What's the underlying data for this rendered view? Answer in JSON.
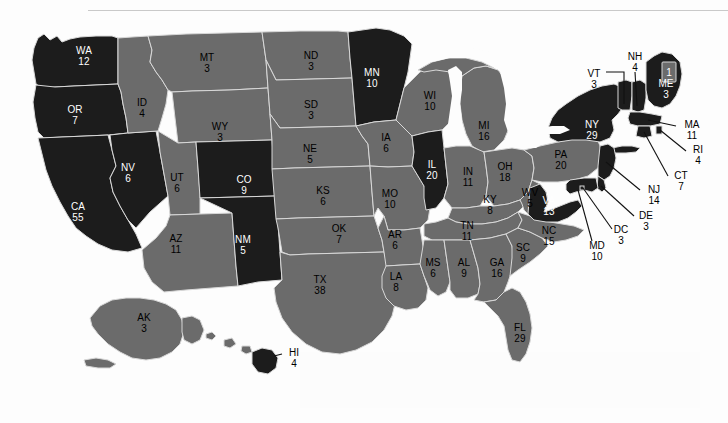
{
  "map": {
    "title": "United States Electoral College Map",
    "colors": {
      "democratic": "#1c1c1c",
      "republican": "#6b6b6b",
      "background": "#fdfdfd",
      "border": "#d8d8d8",
      "water": "#fdfdfd",
      "label_on_dark": "#ffffff",
      "label_on_gray": "#000000",
      "leader_line": "#111111"
    },
    "maine_district_box_label": "1"
  },
  "chart_data": {
    "type": "map",
    "legend": [
      {
        "name": "Democratic",
        "color": "#1c1c1c"
      },
      {
        "name": "Republican",
        "color": "#6b6b6b"
      }
    ],
    "total_electoral_votes": 538,
    "states": [
      {
        "abbr": "WA",
        "votes": "12",
        "party": "democratic"
      },
      {
        "abbr": "OR",
        "votes": "7",
        "party": "democratic"
      },
      {
        "abbr": "CA",
        "votes": "55",
        "party": "democratic"
      },
      {
        "abbr": "NV",
        "votes": "6",
        "party": "democratic"
      },
      {
        "abbr": "ID",
        "votes": "4",
        "party": "republican"
      },
      {
        "abbr": "MT",
        "votes": "3",
        "party": "republican"
      },
      {
        "abbr": "WY",
        "votes": "3",
        "party": "republican"
      },
      {
        "abbr": "UT",
        "votes": "6",
        "party": "republican"
      },
      {
        "abbr": "CO",
        "votes": "9",
        "party": "democratic"
      },
      {
        "abbr": "AZ",
        "votes": "11",
        "party": "republican"
      },
      {
        "abbr": "NM",
        "votes": "5",
        "party": "democratic"
      },
      {
        "abbr": "ND",
        "votes": "3",
        "party": "republican"
      },
      {
        "abbr": "SD",
        "votes": "3",
        "party": "republican"
      },
      {
        "abbr": "NE",
        "votes": "5",
        "party": "republican"
      },
      {
        "abbr": "KS",
        "votes": "6",
        "party": "republican"
      },
      {
        "abbr": "OK",
        "votes": "7",
        "party": "republican"
      },
      {
        "abbr": "TX",
        "votes": "38",
        "party": "republican"
      },
      {
        "abbr": "MN",
        "votes": "10",
        "party": "democratic"
      },
      {
        "abbr": "IA",
        "votes": "6",
        "party": "republican"
      },
      {
        "abbr": "MO",
        "votes": "10",
        "party": "republican"
      },
      {
        "abbr": "AR",
        "votes": "6",
        "party": "republican"
      },
      {
        "abbr": "LA",
        "votes": "8",
        "party": "republican"
      },
      {
        "abbr": "WI",
        "votes": "10",
        "party": "republican"
      },
      {
        "abbr": "IL",
        "votes": "20",
        "party": "democratic"
      },
      {
        "abbr": "MI",
        "votes": "16",
        "party": "republican"
      },
      {
        "abbr": "IN",
        "votes": "11",
        "party": "republican"
      },
      {
        "abbr": "OH",
        "votes": "18",
        "party": "republican"
      },
      {
        "abbr": "KY",
        "votes": "8",
        "party": "republican"
      },
      {
        "abbr": "WV",
        "votes": "5",
        "party": "republican"
      },
      {
        "abbr": "TN",
        "votes": "11",
        "party": "republican"
      },
      {
        "abbr": "MS",
        "votes": "6",
        "party": "republican"
      },
      {
        "abbr": "AL",
        "votes": "9",
        "party": "republican"
      },
      {
        "abbr": "GA",
        "votes": "16",
        "party": "republican"
      },
      {
        "abbr": "SC",
        "votes": "9",
        "party": "republican"
      },
      {
        "abbr": "NC",
        "votes": "15",
        "party": "republican"
      },
      {
        "abbr": "FL",
        "votes": "29",
        "party": "republican"
      },
      {
        "abbr": "VA",
        "votes": "13",
        "party": "democratic"
      },
      {
        "abbr": "PA",
        "votes": "20",
        "party": "republican"
      },
      {
        "abbr": "NY",
        "votes": "29",
        "party": "democratic"
      },
      {
        "abbr": "ME",
        "votes": "3",
        "party": "democratic"
      },
      {
        "abbr": "VT",
        "votes": "3",
        "party": "democratic"
      },
      {
        "abbr": "NH",
        "votes": "4",
        "party": "democratic"
      },
      {
        "abbr": "MA",
        "votes": "11",
        "party": "democratic"
      },
      {
        "abbr": "RI",
        "votes": "4",
        "party": "democratic"
      },
      {
        "abbr": "CT",
        "votes": "7",
        "party": "democratic"
      },
      {
        "abbr": "NJ",
        "votes": "14",
        "party": "democratic"
      },
      {
        "abbr": "DE",
        "votes": "3",
        "party": "democratic"
      },
      {
        "abbr": "MD",
        "votes": "10",
        "party": "democratic"
      },
      {
        "abbr": "DC",
        "votes": "3",
        "party": "democratic"
      },
      {
        "abbr": "AK",
        "votes": "3",
        "party": "republican"
      },
      {
        "abbr": "HI",
        "votes": "4",
        "party": "democratic"
      }
    ]
  },
  "labels": {
    "inline": [
      {
        "abbr": "WA",
        "votes": "12",
        "x": 84,
        "y": 56,
        "tone": "on-dark"
      },
      {
        "abbr": "OR",
        "votes": "7",
        "x": 75,
        "y": 115,
        "tone": "on-dark"
      },
      {
        "abbr": "CA",
        "votes": "55",
        "x": 78,
        "y": 212,
        "tone": "on-dark"
      },
      {
        "abbr": "NV",
        "votes": "6",
        "x": 128,
        "y": 173,
        "tone": "on-dark"
      },
      {
        "abbr": "ID",
        "votes": "4",
        "x": 142,
        "y": 108,
        "tone": "on-gray"
      },
      {
        "abbr": "MT",
        "votes": "3",
        "x": 207,
        "y": 63,
        "tone": "on-gray"
      },
      {
        "abbr": "WY",
        "votes": "3",
        "x": 220,
        "y": 132,
        "tone": "on-gray"
      },
      {
        "abbr": "UT",
        "votes": "6",
        "x": 177,
        "y": 183,
        "tone": "on-gray"
      },
      {
        "abbr": "CO",
        "votes": "9",
        "x": 244,
        "y": 185,
        "tone": "on-dark"
      },
      {
        "abbr": "AZ",
        "votes": "11",
        "x": 176,
        "y": 244,
        "tone": "on-gray"
      },
      {
        "abbr": "NM",
        "votes": "5",
        "x": 243,
        "y": 245,
        "tone": "on-dark"
      },
      {
        "abbr": "ND",
        "votes": "3",
        "x": 311,
        "y": 61,
        "tone": "on-gray"
      },
      {
        "abbr": "SD",
        "votes": "3",
        "x": 311,
        "y": 110,
        "tone": "on-gray"
      },
      {
        "abbr": "NE",
        "votes": "5",
        "x": 310,
        "y": 154,
        "tone": "on-gray"
      },
      {
        "abbr": "KS",
        "votes": "6",
        "x": 323,
        "y": 196,
        "tone": "on-gray"
      },
      {
        "abbr": "OK",
        "votes": "7",
        "x": 339,
        "y": 234,
        "tone": "on-gray"
      },
      {
        "abbr": "TX",
        "votes": "38",
        "x": 320,
        "y": 285,
        "tone": "on-gray"
      },
      {
        "abbr": "MN",
        "votes": "10",
        "x": 372,
        "y": 78,
        "tone": "on-dark"
      },
      {
        "abbr": "IA",
        "votes": "6",
        "x": 386,
        "y": 143,
        "tone": "on-gray"
      },
      {
        "abbr": "MO",
        "votes": "10",
        "x": 390,
        "y": 199,
        "tone": "on-gray"
      },
      {
        "abbr": "AR",
        "votes": "6",
        "x": 395,
        "y": 240,
        "tone": "on-gray"
      },
      {
        "abbr": "LA",
        "votes": "8",
        "x": 396,
        "y": 282,
        "tone": "on-gray"
      },
      {
        "abbr": "WI",
        "votes": "10",
        "x": 430,
        "y": 101,
        "tone": "on-gray"
      },
      {
        "abbr": "IL",
        "votes": "20",
        "x": 432,
        "y": 170,
        "tone": "on-dark"
      },
      {
        "abbr": "MI",
        "votes": "16",
        "x": 484,
        "y": 131,
        "tone": "on-gray"
      },
      {
        "abbr": "IN",
        "votes": "11",
        "x": 468,
        "y": 177,
        "tone": "on-gray"
      },
      {
        "abbr": "OH",
        "votes": "18",
        "x": 505,
        "y": 172,
        "tone": "on-gray"
      },
      {
        "abbr": "KY",
        "votes": "8",
        "x": 490,
        "y": 205,
        "tone": "on-gray"
      },
      {
        "abbr": "WV",
        "votes": "5",
        "x": 530,
        "y": 198,
        "tone": "on-gray"
      },
      {
        "abbr": "TN",
        "votes": "11",
        "x": 467,
        "y": 231,
        "tone": "on-gray"
      },
      {
        "abbr": "MS",
        "votes": "6",
        "x": 433,
        "y": 268,
        "tone": "on-gray"
      },
      {
        "abbr": "AL",
        "votes": "9",
        "x": 464,
        "y": 268,
        "tone": "on-gray"
      },
      {
        "abbr": "GA",
        "votes": "16",
        "x": 497,
        "y": 268,
        "tone": "on-gray"
      },
      {
        "abbr": "SC",
        "votes": "9",
        "x": 523,
        "y": 253,
        "tone": "on-gray"
      },
      {
        "abbr": "NC",
        "votes": "15",
        "x": 549,
        "y": 236,
        "tone": "on-gray"
      },
      {
        "abbr": "FL",
        "votes": "29",
        "x": 520,
        "y": 333,
        "tone": "on-gray"
      },
      {
        "abbr": "VA",
        "votes": "13",
        "x": 549,
        "y": 206,
        "tone": "on-dark"
      },
      {
        "abbr": "PA",
        "votes": "20",
        "x": 561,
        "y": 160,
        "tone": "on-gray"
      },
      {
        "abbr": "NY",
        "votes": "29",
        "x": 592,
        "y": 130,
        "tone": "on-dark"
      },
      {
        "abbr": "ME",
        "votes": "3",
        "x": 666,
        "y": 89,
        "tone": "on-dark"
      },
      {
        "abbr": "AK",
        "votes": "3",
        "x": 144,
        "y": 323,
        "tone": "on-gray"
      }
    ],
    "callouts": [
      {
        "abbr": "VT",
        "votes": "3",
        "x": 594,
        "y": 79
      },
      {
        "abbr": "NH",
        "votes": "4",
        "x": 635,
        "y": 62
      },
      {
        "abbr": "MA",
        "votes": "11",
        "x": 692,
        "y": 130
      },
      {
        "abbr": "RI",
        "votes": "4",
        "x": 698,
        "y": 155
      },
      {
        "abbr": "CT",
        "votes": "7",
        "x": 681,
        "y": 181
      },
      {
        "abbr": "NJ",
        "votes": "14",
        "x": 654,
        "y": 195
      },
      {
        "abbr": "DE",
        "votes": "3",
        "x": 646,
        "y": 221
      },
      {
        "abbr": "DC",
        "votes": "3",
        "x": 621,
        "y": 235
      },
      {
        "abbr": "MD",
        "votes": "10",
        "x": 597,
        "y": 251
      },
      {
        "abbr": "HI",
        "votes": "4",
        "x": 294,
        "y": 358
      }
    ]
  }
}
